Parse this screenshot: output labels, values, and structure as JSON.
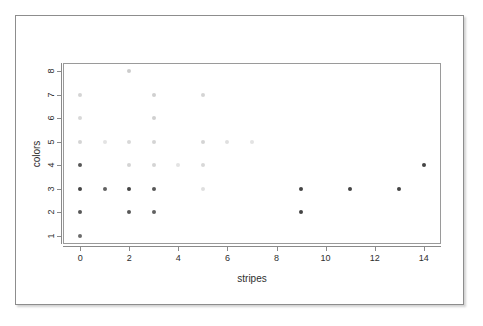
{
  "figure": {
    "background_color": "#ffffff",
    "frame_color": "#8d8d8d",
    "panel_color": "#9a9a9a",
    "point_color": "#3a3a3a"
  },
  "chart_data": {
    "type": "scatter",
    "title": "",
    "xlabel": "stripes",
    "ylabel": "colors",
    "xlim": [
      -0.7,
      14.7
    ],
    "ylim": [
      0.65,
      8.35
    ],
    "grid": false,
    "legend": null,
    "x_ticks": [
      0,
      2,
      4,
      6,
      8,
      10,
      12,
      14
    ],
    "x_tick_labels": [
      "0",
      "2",
      "4",
      "6",
      "8",
      "10",
      "12",
      "14"
    ],
    "y_ticks": [
      1,
      2,
      3,
      4,
      5,
      6,
      7,
      8
    ],
    "y_tick_labels": [
      "1",
      "2",
      "3",
      "4",
      "5",
      "6",
      "7",
      "8"
    ],
    "note": "Opacity encodes overplotting density: darker markers = more overlapping observations.",
    "points": [
      {
        "x": 0,
        "y": 1,
        "alpha": 0.75
      },
      {
        "x": 0,
        "y": 2,
        "alpha": 0.85
      },
      {
        "x": 0,
        "y": 3,
        "alpha": 0.95
      },
      {
        "x": 0,
        "y": 4,
        "alpha": 0.85
      },
      {
        "x": 0,
        "y": 5,
        "alpha": 0.22
      },
      {
        "x": 0,
        "y": 6,
        "alpha": 0.2
      },
      {
        "x": 0,
        "y": 7,
        "alpha": 0.22
      },
      {
        "x": 1,
        "y": 3,
        "alpha": 0.8
      },
      {
        "x": 1,
        "y": 5,
        "alpha": 0.14
      },
      {
        "x": 2,
        "y": 2,
        "alpha": 0.85
      },
      {
        "x": 2,
        "y": 3,
        "alpha": 0.95
      },
      {
        "x": 2,
        "y": 4,
        "alpha": 0.22
      },
      {
        "x": 2,
        "y": 5,
        "alpha": 0.2
      },
      {
        "x": 2,
        "y": 8,
        "alpha": 0.26
      },
      {
        "x": 3,
        "y": 2,
        "alpha": 0.8
      },
      {
        "x": 3,
        "y": 3,
        "alpha": 0.85
      },
      {
        "x": 3,
        "y": 4,
        "alpha": 0.22
      },
      {
        "x": 3,
        "y": 5,
        "alpha": 0.22
      },
      {
        "x": 3,
        "y": 6,
        "alpha": 0.24
      },
      {
        "x": 3,
        "y": 7,
        "alpha": 0.24
      },
      {
        "x": 4,
        "y": 4,
        "alpha": 0.14
      },
      {
        "x": 5,
        "y": 3,
        "alpha": 0.16
      },
      {
        "x": 5,
        "y": 4,
        "alpha": 0.2
      },
      {
        "x": 5,
        "y": 5,
        "alpha": 0.22
      },
      {
        "x": 5,
        "y": 7,
        "alpha": 0.22
      },
      {
        "x": 6,
        "y": 5,
        "alpha": 0.16
      },
      {
        "x": 7,
        "y": 5,
        "alpha": 0.14
      },
      {
        "x": 9,
        "y": 2,
        "alpha": 0.95
      },
      {
        "x": 9,
        "y": 3,
        "alpha": 0.95
      },
      {
        "x": 11,
        "y": 3,
        "alpha": 0.95
      },
      {
        "x": 13,
        "y": 3,
        "alpha": 0.95
      },
      {
        "x": 14,
        "y": 4,
        "alpha": 0.95
      }
    ]
  }
}
